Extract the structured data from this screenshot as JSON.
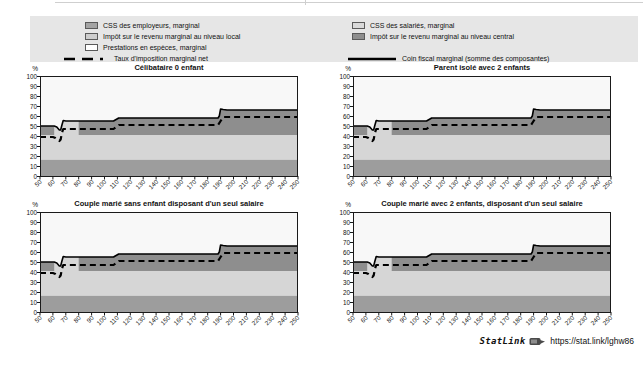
{
  "page": {
    "top_rule": true
  },
  "legend": {
    "background": "#e6e6e6",
    "left_column": [
      {
        "kind": "swatch",
        "color": "#a4a4a4",
        "name": "css-employeurs",
        "label": "CSS des employeurs, marginal"
      },
      {
        "kind": "swatch",
        "color": "#cdcdcd",
        "name": "impot-local",
        "label": "Impôt sur le revenu marginal au niveau local"
      },
      {
        "kind": "swatch",
        "color": "#ffffff",
        "name": "prestations-especes",
        "label": "Prestations en espèces, marginal"
      },
      {
        "kind": "dashed",
        "color": "#000000",
        "name": "taux-marginal-net",
        "label": "Taux d'imposition marginal net"
      }
    ],
    "right_column": [
      {
        "kind": "swatch",
        "color": "#d9d9d9",
        "name": "css-salaries",
        "label": "CSS des salariés, marginal"
      },
      {
        "kind": "swatch",
        "color": "#8e8e8e",
        "name": "impot-central",
        "label": "Impôt sur le revenu marginal au niveau central"
      },
      {
        "kind": "spacer",
        "label": ""
      },
      {
        "kind": "solid",
        "color": "#000000",
        "name": "coin-fiscal-marginal",
        "label": "Coin fiscal marginal (somme des composantes)"
      }
    ]
  },
  "chart_data": {
    "type": "area",
    "note": "Stacked marginal tax-wedge components as % of labour costs, by % of average wage; all four panels depict identical values",
    "x": {
      "min": 50,
      "max": 250,
      "tick_labels": [
        "50",
        "60",
        "70",
        "80",
        "90",
        "100",
        "110",
        "120",
        "130",
        "140",
        "150",
        "160",
        "170",
        "180",
        "190",
        "200",
        "210",
        "220",
        "230",
        "240",
        "250"
      ]
    },
    "y": {
      "unit": "%",
      "min": 0,
      "max": 100,
      "tick_labels": [
        "100",
        "90",
        "80",
        "70",
        "60",
        "50",
        "40",
        "30",
        "20",
        "10",
        "0"
      ]
    },
    "panels": [
      {
        "title": "Célibataire 0 enfant"
      },
      {
        "title": "Parent isolé avec 2 enfants"
      },
      {
        "title": "Couple marié sans enfant disposant d'un seul salaire"
      },
      {
        "title": "Couple marié avec 2 enfants, disposant d'un seul salaire"
      }
    ],
    "plot_background": "#f8f8f8",
    "stack_bands": [
      {
        "name": "css-employeurs-band",
        "color": "#9d9d9d",
        "from": 0,
        "to": 16.5
      },
      {
        "name": "css-salaries-band",
        "color": "#d6d6d6",
        "from": 16.5,
        "to": 41
      },
      {
        "name": "impot-central-band",
        "color": "#8e8e8e",
        "from": 41,
        "to": "coin-fiscal-line"
      }
    ],
    "light_segment": {
      "name": "css-salaries-upper-segment",
      "color": "#d6d6d6",
      "base": 41,
      "outline": [
        [
          61,
          49.5
        ],
        [
          63,
          49
        ],
        [
          65,
          46
        ],
        [
          66,
          46
        ],
        [
          67,
          51
        ],
        [
          68,
          55.5
        ],
        [
          70,
          55
        ],
        [
          80,
          55
        ]
      ]
    },
    "series": [
      {
        "name": "Coin fiscal marginal (somme des composantes)",
        "style": "solid",
        "color": "#000000",
        "points": [
          [
            50,
            50
          ],
          [
            61,
            50
          ],
          [
            63,
            49
          ],
          [
            65,
            46
          ],
          [
            66,
            46
          ],
          [
            67,
            51
          ],
          [
            68,
            55.5
          ],
          [
            70,
            55
          ],
          [
            107,
            55
          ],
          [
            109,
            56.5
          ],
          [
            111,
            58
          ],
          [
            188,
            58
          ],
          [
            189,
            60
          ],
          [
            190,
            67
          ],
          [
            192,
            66.5
          ],
          [
            195,
            66
          ],
          [
            250,
            66
          ]
        ]
      },
      {
        "name": "Taux d'imposition marginal net",
        "style": "dashed",
        "color": "#000000",
        "points": [
          [
            50,
            39
          ],
          [
            60,
            39
          ],
          [
            62,
            38
          ],
          [
            64,
            36
          ],
          [
            65,
            35
          ],
          [
            66,
            36.5
          ],
          [
            67,
            43
          ],
          [
            68,
            47
          ],
          [
            107,
            47
          ],
          [
            109,
            49
          ],
          [
            111,
            51
          ],
          [
            188,
            51
          ],
          [
            190,
            55
          ],
          [
            192,
            59
          ],
          [
            250,
            59
          ]
        ]
      }
    ]
  },
  "statlink": {
    "label": "StatLink",
    "url": "https://stat.link/lghw86"
  }
}
